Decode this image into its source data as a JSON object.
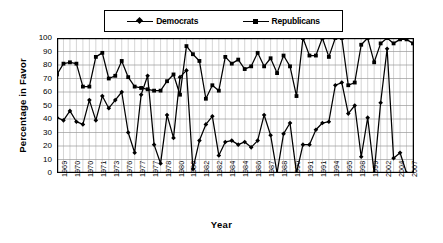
{
  "chart_data": {
    "type": "line",
    "title": "",
    "xlabel": "Year",
    "ylabel": "Percentage in Favor",
    "ylim": [
      0,
      100
    ],
    "ytick_values": [
      0,
      10,
      20,
      30,
      40,
      50,
      60,
      70,
      80,
      90,
      100
    ],
    "grid": true,
    "legend_position": "top-center",
    "x_tick_labels": [
      "1969",
      "1970",
      "1970",
      "1971",
      "1973",
      "1976",
      "1977",
      "1977",
      "1978",
      "1980",
      "1980",
      "1982",
      "1982",
      "1984",
      "1984",
      "1986",
      "1987",
      "1988",
      "1990",
      "1991",
      "1991",
      "1994",
      "1995",
      "1998",
      "1999",
      "2002",
      "2004",
      "2007"
    ],
    "x_label_stride": 2,
    "n_points": 56,
    "series": [
      {
        "name": "Democrats",
        "marker": "diamond",
        "color": "#000000",
        "values": [
          41,
          39,
          46,
          38,
          36,
          54,
          39,
          57,
          48,
          54,
          60,
          30,
          15,
          58,
          72,
          21,
          7,
          43,
          26,
          71,
          76,
          3,
          24,
          36,
          42,
          13,
          23,
          24,
          21,
          23,
          19,
          24,
          43,
          28,
          0,
          29,
          37,
          0,
          21,
          21,
          32,
          37,
          38,
          65,
          67,
          44,
          50,
          12,
          41,
          0,
          52,
          92,
          11,
          15,
          0,
          0
        ]
      },
      {
        "name": "Republicans",
        "marker": "square",
        "color": "#000000",
        "values": [
          73,
          81,
          82,
          81,
          64,
          64,
          86,
          89,
          70,
          72,
          83,
          71,
          64,
          63,
          62,
          61,
          61,
          68,
          73,
          58,
          94,
          88,
          83,
          55,
          65,
          61,
          86,
          81,
          84,
          77,
          79,
          89,
          79,
          85,
          74,
          87,
          79,
          57,
          100,
          87,
          87,
          100,
          86,
          100,
          100,
          65,
          67,
          95,
          100,
          82,
          96,
          100,
          96,
          99,
          99,
          96
        ]
      }
    ]
  },
  "legend": {
    "entries": [
      {
        "label": "Democrats",
        "marker": "diamond"
      },
      {
        "label": "Republicans",
        "marker": "square"
      }
    ]
  },
  "axes": {
    "y_title": "Percentage in Favor",
    "x_title": "Year"
  }
}
